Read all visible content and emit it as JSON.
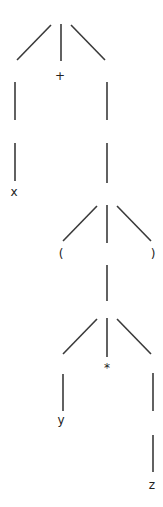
{
  "diagram": {
    "type": "parse-tree",
    "background": "#ffffff",
    "line_color": "#3a3a3a",
    "text_color": "#222222",
    "labels": [
      {
        "id": "plus",
        "text": "+",
        "x": 60,
        "y": 80
      },
      {
        "id": "x",
        "text": "x",
        "x": 14,
        "y": 196
      },
      {
        "id": "lparen",
        "text": "(",
        "x": 61,
        "y": 258
      },
      {
        "id": "rparen",
        "text": ")",
        "x": 153,
        "y": 258
      },
      {
        "id": "star",
        "text": "*",
        "x": 107,
        "y": 372
      },
      {
        "id": "y",
        "text": "y",
        "x": 61,
        "y": 424
      },
      {
        "id": "z",
        "text": "z",
        "x": 152,
        "y": 489
      }
    ],
    "edges": [
      {
        "x1": 51,
        "y1": 25,
        "x2": 17,
        "y2": 60
      },
      {
        "x1": 61,
        "y1": 24,
        "x2": 61,
        "y2": 61
      },
      {
        "x1": 71,
        "y1": 25,
        "x2": 105,
        "y2": 60
      },
      {
        "x1": 15,
        "y1": 82,
        "x2": 15,
        "y2": 120
      },
      {
        "x1": 15,
        "y1": 143,
        "x2": 15,
        "y2": 181
      },
      {
        "x1": 107,
        "y1": 82,
        "x2": 107,
        "y2": 120
      },
      {
        "x1": 107,
        "y1": 143,
        "x2": 107,
        "y2": 183
      },
      {
        "x1": 97,
        "y1": 206,
        "x2": 63,
        "y2": 241
      },
      {
        "x1": 107,
        "y1": 205,
        "x2": 107,
        "y2": 243
      },
      {
        "x1": 117,
        "y1": 206,
        "x2": 151,
        "y2": 241
      },
      {
        "x1": 107,
        "y1": 265,
        "x2": 107,
        "y2": 301
      },
      {
        "x1": 97,
        "y1": 319,
        "x2": 63,
        "y2": 354
      },
      {
        "x1": 107,
        "y1": 318,
        "x2": 107,
        "y2": 357
      },
      {
        "x1": 117,
        "y1": 319,
        "x2": 151,
        "y2": 354
      },
      {
        "x1": 63,
        "y1": 374,
        "x2": 63,
        "y2": 411
      },
      {
        "x1": 153,
        "y1": 373,
        "x2": 153,
        "y2": 411
      },
      {
        "x1": 153,
        "y1": 435,
        "x2": 153,
        "y2": 472
      }
    ]
  }
}
